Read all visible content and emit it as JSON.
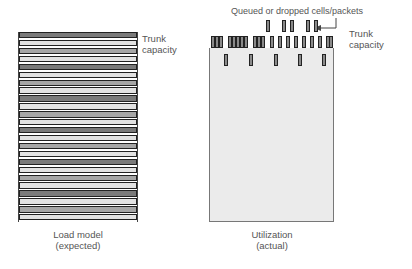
{
  "left_panel": {
    "label_line1": "Trunk",
    "label_line2": "capacity",
    "caption_line1": "Load model",
    "caption_line2": "(expected)",
    "stripe_colors": [
      "#7a7a7a",
      "#e2e2e2",
      "#a6a6a6"
    ]
  },
  "right_panel": {
    "annotation": "Queued or dropped cells/packets",
    "label_line1": "Trunk",
    "label_line2": "capacity",
    "caption_line1": "Utilization",
    "caption_line2": "(actual)",
    "fill_color": "#ebebeb",
    "bar_color": "#8a8a8a"
  }
}
